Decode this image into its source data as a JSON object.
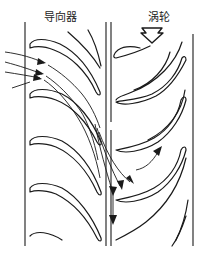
{
  "diagram": {
    "labels": {
      "guide_vane": "导向器",
      "turbine": "涡轮"
    },
    "components": [
      {
        "id": "guide-vane-row",
        "label": "导向器",
        "type": "stator-blade-row",
        "blade_count_visible": 4
      },
      {
        "id": "turbine-rotor-row",
        "label": "涡轮",
        "type": "rotor-blade-row",
        "blade_count_visible": 5
      }
    ],
    "indicators": {
      "rotation_arrow": "down-hollow-arrow",
      "inlet_flow_arrows": 3,
      "outlet_flow_arrows": 4
    },
    "colors": {
      "line": "#1a1a1a",
      "background": "#ffffff"
    }
  }
}
